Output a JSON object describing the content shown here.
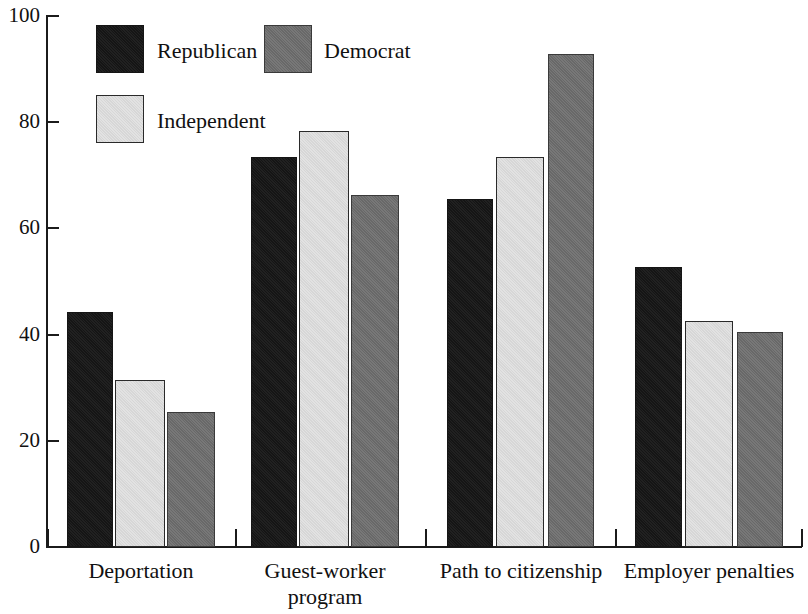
{
  "chart_data": {
    "type": "bar",
    "title": "",
    "subtitle": "",
    "xlabel": "",
    "ylabel": "",
    "ylim": [
      0,
      100
    ],
    "yticks": [
      0,
      20,
      40,
      60,
      80,
      100
    ],
    "grid": false,
    "legend_position": "top-left",
    "categories": [
      "Deportation",
      "Guest-worker program",
      "Path to citizenship",
      "Employer penalties"
    ],
    "category_lines": [
      [
        "Deportation"
      ],
      [
        "Guest-worker",
        "program"
      ],
      [
        "Path to citizenship"
      ],
      [
        "Employer penalties"
      ]
    ],
    "series": [
      {
        "name": "Republican",
        "color": "#151515",
        "values": [
          44.2,
          73.4,
          65.5,
          52.7
        ]
      },
      {
        "name": "Independent",
        "color": "#e2e2e2",
        "values": [
          31.4,
          78.4,
          73.4,
          42.6
        ]
      },
      {
        "name": "Democrat",
        "color": "#6e6e6e",
        "values": [
          25.4,
          66.3,
          92.8,
          40.5
        ]
      }
    ]
  },
  "axis": {
    "y_tick_labels": [
      "0",
      "20",
      "40",
      "60",
      "80",
      "100"
    ]
  },
  "legend": {
    "entries": [
      {
        "label": "Republican"
      },
      {
        "label": "Democrat"
      },
      {
        "label": "Independent"
      }
    ]
  }
}
